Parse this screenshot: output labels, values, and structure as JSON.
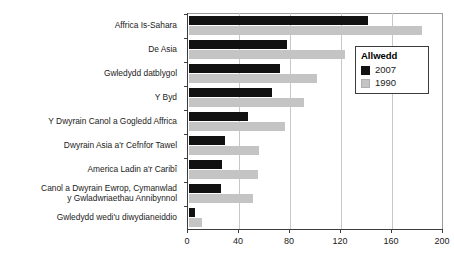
{
  "chart_data": {
    "type": "bar",
    "orientation": "horizontal",
    "title": "",
    "xlabel": "",
    "ylabel": "",
    "xlim": [
      0,
      200
    ],
    "xticks": [
      0,
      40,
      80,
      120,
      160,
      200
    ],
    "grid": true,
    "legend": {
      "title": "Allwedd",
      "position": "upper-right",
      "entries": [
        {
          "name": "2007",
          "color": "#111111"
        },
        {
          "name": "1990",
          "color": "#c4c4c4"
        }
      ]
    },
    "categories": [
      "Affrica Is-Sahara",
      "De Asia",
      "Gwledydd datblygol",
      "Y Byd",
      "Y Dwyrain Canol a Gogledd Affrica",
      "Dwyrain Asia a'r Cefnfor Tawel",
      "America Ladin a'r Caribî",
      "Canol a Dwyrain Ewrop, Cymanwlad\ny Gwladwriaethau Annibynnol",
      "Gwledydd wedi'u diwydianeiddio"
    ],
    "series": [
      {
        "name": "2007",
        "color": "#111111",
        "values": [
          140,
          77,
          71,
          65,
          46,
          28,
          26,
          25,
          5
        ]
      },
      {
        "name": "1990",
        "color": "#c4c4c4",
        "values": [
          183,
          122,
          100,
          90,
          75,
          55,
          54,
          50,
          10
        ]
      }
    ]
  }
}
